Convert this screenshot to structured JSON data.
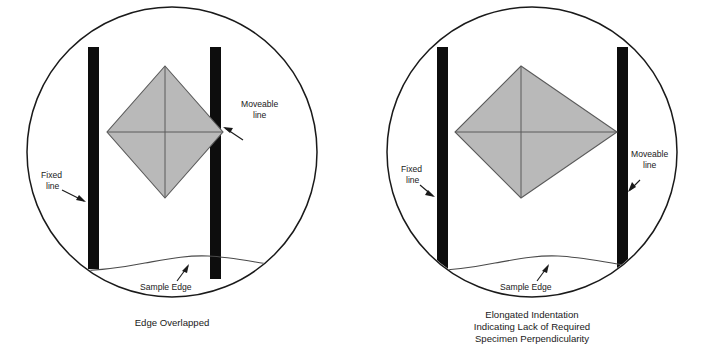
{
  "figure": {
    "background_color": "#ffffff",
    "outline_color": "#1a1a1a",
    "bar_color": "#0d0d0d",
    "indent_fill_color": "#b9b9b9",
    "indent_stroke_color": "#5a5a5a",
    "sample_edge_color": "#4a4a4a"
  },
  "panels": [
    {
      "id": "left",
      "caption_lines": [
        "Edge Overlapped"
      ],
      "labels": {
        "fixed_line": "Fixed\nline",
        "fixed_line_l1": "Fixed",
        "fixed_line_l2": "line",
        "moveable_line_l1": "Moveable",
        "moveable_line_l2": "line",
        "sample_edge": "Sample Edge"
      },
      "indent": {
        "shape": "symmetric-diamond",
        "description": "Square Vickers indentation overlapping the moveable line"
      }
    },
    {
      "id": "right",
      "caption_lines": [
        "Elongated Indentation",
        "Indicating Lack of Required",
        "Specimen Perpendicularity"
      ],
      "labels": {
        "fixed_line_l1": "Fixed",
        "fixed_line_l2": "line",
        "moveable_line_l1": "Moveable",
        "moveable_line_l2": "line",
        "sample_edge": "Sample Edge"
      },
      "indent": {
        "shape": "elongated-diamond",
        "description": "Elongated indentation skewed to the right"
      }
    }
  ]
}
